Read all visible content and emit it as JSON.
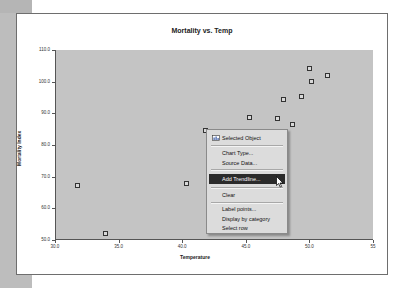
{
  "chart_data": {
    "type": "scatter",
    "title": "Mortality vs. Temp",
    "xlabel": "Temperature",
    "ylabel": "Mortality Index",
    "xlim": [
      30,
      55
    ],
    "ylim": [
      50,
      110
    ],
    "x_ticks": [
      "30.0",
      "35.0",
      "40.0",
      "45.0",
      "50.0",
      "55"
    ],
    "y_ticks": [
      "110.0",
      "100.0",
      "90.0",
      "80.0",
      "70.0",
      "60.0",
      "50.0"
    ],
    "grid": false,
    "legend": null,
    "series": [
      {
        "name": "Mortality Index",
        "marker": "square",
        "points": [
          {
            "x": 31.8,
            "y": 67.1
          },
          {
            "x": 34.0,
            "y": 52.2
          },
          {
            "x": 40.3,
            "y": 67.7
          },
          {
            "x": 41.8,
            "y": 84.7
          },
          {
            "x": 45.3,
            "y": 88.8
          },
          {
            "x": 47.5,
            "y": 88.5
          },
          {
            "x": 48.0,
            "y": 94.5
          },
          {
            "x": 48.7,
            "y": 86.6
          },
          {
            "x": 49.4,
            "y": 95.2
          },
          {
            "x": 50.0,
            "y": 104.3
          },
          {
            "x": 50.2,
            "y": 99.9
          },
          {
            "x": 51.4,
            "y": 101.8
          }
        ]
      }
    ],
    "plot_background": "#c4c4c4"
  },
  "context_menu": {
    "items": [
      {
        "label": "Selected Object",
        "icon": "chart-object-icon"
      },
      {
        "label": "Chart Type..."
      },
      {
        "label": "Source Data..."
      },
      {
        "label": "Add Trendline...",
        "highlighted": true
      },
      {
        "label": "Clear"
      },
      {
        "label": "Label points..."
      },
      {
        "label": "Display by category"
      },
      {
        "label": "Select row"
      }
    ]
  },
  "colors": {
    "menu_highlight": "#2b2b2b",
    "menu_background": "#dcdcdc",
    "side_strip": "#bdbdbd"
  }
}
